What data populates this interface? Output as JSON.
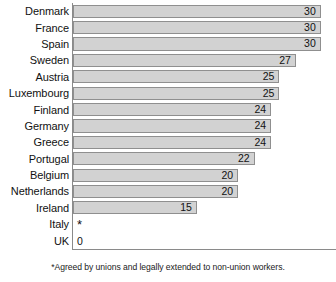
{
  "chart_data": {
    "type": "bar",
    "orientation": "horizontal",
    "title": "",
    "xlabel": "",
    "ylabel": "",
    "xlim": [
      0,
      31
    ],
    "grid": false,
    "legend": null,
    "categories": [
      "Denmark",
      "France",
      "Spain",
      "Sweden",
      "Austria",
      "Luxembourg",
      "Finland",
      "Germany",
      "Greece",
      "Portugal",
      "Belgium",
      "Netherlands",
      "Ireland",
      "Italy",
      "UK"
    ],
    "values": [
      30,
      30,
      30,
      27,
      25,
      25,
      24,
      24,
      24,
      22,
      20,
      20,
      15,
      null,
      0
    ],
    "value_labels": [
      "30",
      "30",
      "30",
      "27",
      "25",
      "25",
      "24",
      "24",
      "24",
      "22",
      "20",
      "20",
      "15",
      "*",
      "0"
    ],
    "bars": [
      {
        "label": "Denmark",
        "value": 30,
        "display": "30",
        "has_bar": true
      },
      {
        "label": "France",
        "value": 30,
        "display": "30",
        "has_bar": true
      },
      {
        "label": "Spain",
        "value": 30,
        "display": "30",
        "has_bar": true
      },
      {
        "label": "Sweden",
        "value": 27,
        "display": "27",
        "has_bar": true
      },
      {
        "label": "Austria",
        "value": 25,
        "display": "25",
        "has_bar": true
      },
      {
        "label": "Luxembourg",
        "value": 25,
        "display": "25",
        "has_bar": true
      },
      {
        "label": "Finland",
        "value": 24,
        "display": "24",
        "has_bar": true
      },
      {
        "label": "Germany",
        "value": 24,
        "display": "24",
        "has_bar": true
      },
      {
        "label": "Greece",
        "value": 24,
        "display": "24",
        "has_bar": true
      },
      {
        "label": "Portugal",
        "value": 22,
        "display": "22",
        "has_bar": true
      },
      {
        "label": "Belgium",
        "value": 20,
        "display": "20",
        "has_bar": true
      },
      {
        "label": "Netherlands",
        "value": 20,
        "display": "20",
        "has_bar": true
      },
      {
        "label": "Ireland",
        "value": 15,
        "display": "15",
        "has_bar": true
      },
      {
        "label": "Italy",
        "value": null,
        "display": "*",
        "has_bar": false
      },
      {
        "label": "UK",
        "value": 0,
        "display": "0",
        "has_bar": false
      }
    ],
    "footnote": "*Agreed by unions and legally extended to non-union workers.",
    "colors": {
      "bar_fill": "#d2d2d2",
      "bar_border": "#8f8f8f",
      "axis": "#8a8a8a",
      "text": "#111111",
      "background": "#ffffff"
    }
  }
}
